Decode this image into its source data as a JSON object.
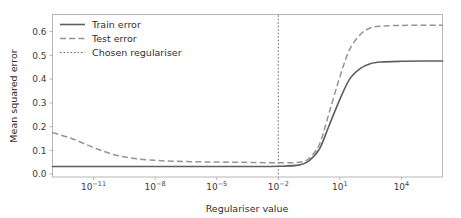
{
  "chart_data": {
    "type": "line",
    "title": "",
    "xlabel": "Regulariser value",
    "ylabel": "Mean squared error",
    "xscale": "log",
    "yscale": "linear",
    "xlim": [
      1e-13,
      1000000.0
    ],
    "ylim": [
      -0.012,
      0.672
    ],
    "grid": false,
    "legend_position": "upper left",
    "x_tick_labels": [
      "10-11",
      "10-8",
      "10-5",
      "10-2",
      "101",
      "104"
    ],
    "x_tick_mantissa": "10",
    "x_tick_exponents": [
      "−11",
      "−8",
      "−5",
      "−2",
      "1",
      "4"
    ],
    "x_tick_values": [
      1e-11,
      1e-08,
      1e-05,
      0.01,
      10,
      10000
    ],
    "y_tick_labels": [
      "0.0",
      "0.1",
      "0.2",
      "0.3",
      "0.4",
      "0.5",
      "0.6"
    ],
    "y_tick_values": [
      0.0,
      0.1,
      0.2,
      0.3,
      0.4,
      0.5,
      0.6
    ],
    "annotations": [
      {
        "name": "chosen-regulariser-line",
        "type": "vline",
        "x": 0.01,
        "label": "Chosen regulariser"
      }
    ],
    "series": [
      {
        "name": "Train error",
        "style": "solid",
        "color": "#5e5e5e",
        "x": [
          1e-13,
          1e-12,
          1e-11,
          1e-10,
          1e-09,
          1e-08,
          1e-07,
          1e-06,
          1e-05,
          0.0001,
          0.001,
          0.01,
          0.1,
          0.3,
          1,
          3,
          10,
          30,
          100,
          300,
          1000,
          10000,
          100000,
          1000000
        ],
        "y": [
          0.032,
          0.032,
          0.032,
          0.032,
          0.032,
          0.032,
          0.032,
          0.032,
          0.032,
          0.032,
          0.032,
          0.033,
          0.038,
          0.055,
          0.105,
          0.205,
          0.315,
          0.4,
          0.445,
          0.465,
          0.472,
          0.475,
          0.476,
          0.476
        ]
      },
      {
        "name": "Test error",
        "style": "dashed",
        "color": "#949494",
        "x": [
          1e-13,
          1e-12,
          1e-11,
          1e-10,
          1e-09,
          1e-08,
          1e-07,
          1e-06,
          1e-05,
          0.0001,
          0.001,
          0.01,
          0.1,
          0.3,
          1,
          3,
          10,
          30,
          100,
          300,
          1000,
          10000,
          100000,
          1000000
        ],
        "y": [
          0.175,
          0.148,
          0.112,
          0.082,
          0.066,
          0.058,
          0.054,
          0.052,
          0.051,
          0.05,
          0.049,
          0.048,
          0.05,
          0.065,
          0.125,
          0.258,
          0.41,
          0.525,
          0.588,
          0.615,
          0.623,
          0.626,
          0.627,
          0.627
        ]
      }
    ]
  },
  "legend": {
    "items": [
      {
        "label": "Train error",
        "style": "solid"
      },
      {
        "label": "Test error",
        "style": "dashed"
      },
      {
        "label": "Chosen regulariser",
        "style": "dotted"
      }
    ]
  },
  "axes": {
    "x_title": "Regulariser value",
    "y_title": "Mean squared error"
  }
}
